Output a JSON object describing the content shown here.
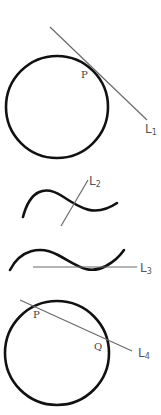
{
  "colors": {
    "curve": "#111111",
    "line": "#6a6a6a",
    "label": "#555555",
    "background": "#ffffff"
  },
  "figures": [
    {
      "id": "fig1",
      "description": "circle with tangent line L1 touching at P",
      "line_label": "L",
      "line_subscript": "1",
      "points": [
        "P"
      ]
    },
    {
      "id": "fig2",
      "description": "wavy curve crossed by line L2",
      "line_label": "L",
      "line_subscript": "2",
      "points": []
    },
    {
      "id": "fig3",
      "description": "wavy curve with horizontal tangent line L3",
      "line_label": "L",
      "line_subscript": "3",
      "points": []
    },
    {
      "id": "fig4",
      "description": "circle with secant line L4 through P and Q",
      "line_label": "L",
      "line_subscript": "4",
      "points": [
        "P",
        "Q"
      ]
    }
  ]
}
